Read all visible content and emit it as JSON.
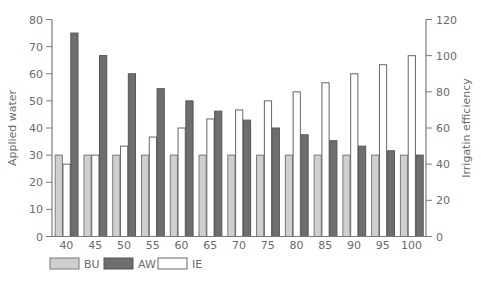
{
  "chart_data": {
    "type": "bar",
    "title": "",
    "xlabel": "",
    "ylabel": "Applied water",
    "y2label": "Irrigatin efficiency",
    "categories": [
      "40",
      "45",
      "50",
      "55",
      "60",
      "65",
      "70",
      "75",
      "80",
      "85",
      "90",
      "95",
      "100"
    ],
    "series": [
      {
        "name": "BU",
        "axis": "left",
        "color": "#cfcfcf",
        "stroke": "#7a7a7a",
        "values": [
          30,
          30,
          30,
          30,
          30,
          30,
          30,
          30,
          30,
          30,
          30,
          30,
          30
        ]
      },
      {
        "name": "IE",
        "axis": "right",
        "color": "#ffffff",
        "stroke": "#666666",
        "values": [
          40,
          45,
          50,
          55,
          60,
          65,
          70,
          75,
          80,
          85,
          90,
          95,
          100
        ]
      },
      {
        "name": "AW",
        "axis": "left",
        "color": "#6e6e6e",
        "stroke": "#555555",
        "values": [
          75,
          66.7,
          60,
          54.5,
          50,
          46.2,
          42.9,
          40,
          37.5,
          35.3,
          33.3,
          31.6,
          30
        ]
      }
    ],
    "bar_order": [
      "BU",
      "IE",
      "AW"
    ],
    "ylim": [
      0,
      80
    ],
    "y2lim": [
      0,
      120
    ],
    "yticks": [
      0,
      10,
      20,
      30,
      40,
      50,
      60,
      70,
      80
    ],
    "y2ticks": [
      0,
      20,
      40,
      60,
      80,
      100,
      120
    ],
    "grid": false,
    "legend": {
      "position": "bottom-left",
      "entries": [
        "BU",
        "AW",
        "IE"
      ]
    }
  },
  "axes": {
    "left_title": "Applied water",
    "right_title": "Irrigatin efficiency"
  },
  "legend": [
    {
      "label": "BU",
      "color": "#cfcfcf",
      "stroke": "#7a7a7a"
    },
    {
      "label": "AW",
      "color": "#6e6e6e",
      "stroke": "#555555"
    },
    {
      "label": "IE",
      "color": "#ffffff",
      "stroke": "#666666"
    }
  ]
}
